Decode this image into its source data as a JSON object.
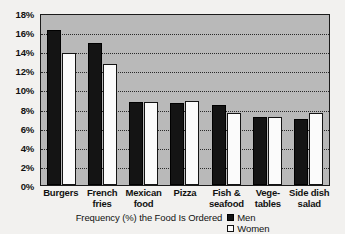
{
  "chart_data": {
    "type": "bar",
    "title": "",
    "xlabel": "Frequency (%) the Food Is Ordered",
    "ylabel": "",
    "ylim": [
      0,
      18
    ],
    "ytick_step": 2,
    "grid": true,
    "legend_position": "bottom-right",
    "categories": [
      "Burgers",
      "French fries",
      "Mexican food",
      "Pizza",
      "Fish & seafood",
      "Vege- tables",
      "Side dish salad"
    ],
    "category_lines": [
      [
        "Burgers"
      ],
      [
        "French",
        "fries"
      ],
      [
        "Mexican",
        "food"
      ],
      [
        "Pizza"
      ],
      [
        "Fish &",
        "seafood"
      ],
      [
        "Vege-",
        "tables"
      ],
      [
        "Side dish",
        "salad"
      ]
    ],
    "ytick_labels": [
      "18%",
      "16%",
      "14%",
      "12%",
      "10%",
      "8%",
      "6%",
      "4%",
      "2%",
      "0%"
    ],
    "ytick_values": [
      18,
      16,
      14,
      12,
      10,
      8,
      6,
      4,
      2,
      0
    ],
    "series": [
      {
        "name": "Men",
        "color": "#141414",
        "values": [
          16.2,
          14.9,
          8.7,
          8.6,
          8.4,
          7.1,
          6.9
        ]
      },
      {
        "name": "Women",
        "color": "#fbfbfb",
        "values": [
          13.8,
          12.7,
          8.7,
          8.8,
          7.5,
          7.1,
          7.5
        ]
      }
    ]
  },
  "caption": {
    "text": "Frequency (%) the Food Is Ordered"
  },
  "legend": {
    "items": [
      {
        "label": "Men"
      },
      {
        "label": "Women"
      }
    ]
  },
  "colors": {
    "plot_background": "#b9b9b9",
    "page_background": "#f2f1ef",
    "axis": "#1b1b1b",
    "gridline": "#2a2a2a",
    "men_bar": "#141414",
    "women_bar": "#fbfbfb"
  }
}
